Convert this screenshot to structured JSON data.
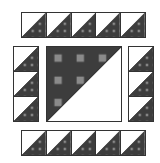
{
  "colors": {
    "dark": "#3d3d3d",
    "speckle": "#8a8a8a",
    "light": "#ffffff",
    "outline": "#333333"
  },
  "block": {
    "top_row": {
      "cells": 5,
      "triangle": "dark-lower-right"
    },
    "bottom_row": {
      "cells": 5,
      "triangle": "dark-lower-right"
    },
    "left_column": {
      "cells": 3,
      "triangle": "dark-lower-right"
    },
    "right_column": {
      "cells": 3,
      "triangle": "dark-lower-right"
    },
    "center": {
      "triangle": "dark-upper-left"
    }
  }
}
